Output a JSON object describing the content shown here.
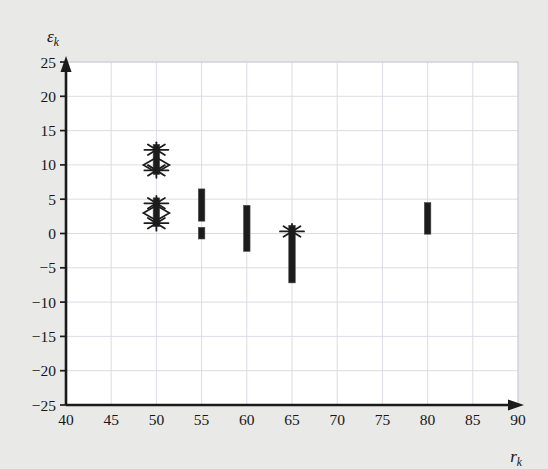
{
  "figure": {
    "background_color": "#e9e9e7",
    "plot_background_color": "#ffffff",
    "axis_color": "#1a1a1a",
    "grid_color": "#d8d8e2",
    "series_color": "#1c1c1c"
  },
  "axes": {
    "y_title": "ε",
    "y_title_sub": "k",
    "x_title": "r",
    "x_title_sub": "k",
    "y_ticks": [
      "25",
      "20",
      "15",
      "10",
      "5",
      "0",
      "−5",
      "−10",
      "−15",
      "−20",
      "−25"
    ],
    "x_ticks": [
      "40",
      "45",
      "50",
      "55",
      "60",
      "65",
      "70",
      "75",
      "80",
      "85",
      "90"
    ]
  },
  "chart_data": {
    "type": "scatter",
    "title": "",
    "xlabel": "r_k",
    "ylabel": "ε_k",
    "xlim": [
      40,
      90
    ],
    "ylim": [
      -25,
      25
    ],
    "xticks": [
      40,
      45,
      50,
      55,
      60,
      65,
      70,
      75,
      80,
      85,
      90
    ],
    "yticks": [
      -25,
      -20,
      -15,
      -10,
      -5,
      0,
      5,
      10,
      15,
      20,
      25
    ],
    "grid": true,
    "legend": "none",
    "groups": [
      {
        "x": 50,
        "y_min": 1.0,
        "y_max": 13.0,
        "segments": [
          {
            "y_min": 8.6,
            "y_max": 13.0
          },
          {
            "y_min": 1.0,
            "y_max": 5.2
          }
        ],
        "markers": [
          {
            "y": 12.2,
            "shape": "asterisk"
          },
          {
            "y": 10.0,
            "shape": "diamond"
          },
          {
            "y": 9.2,
            "shape": "asterisk"
          },
          {
            "y": 4.4,
            "shape": "asterisk"
          },
          {
            "y": 3.0,
            "shape": "diamond"
          },
          {
            "y": 1.5,
            "shape": "asterisk"
          }
        ]
      },
      {
        "x": 55,
        "y_min": -0.8,
        "y_max": 6.5,
        "segments": [
          {
            "y_min": 1.8,
            "y_max": 6.5
          },
          {
            "y_min": -0.8,
            "y_max": 0.9
          }
        ],
        "markers": []
      },
      {
        "x": 60,
        "y_min": -2.6,
        "y_max": 4.1,
        "segments": [
          {
            "y_min": -2.6,
            "y_max": 4.1
          }
        ],
        "markers": []
      },
      {
        "x": 65,
        "y_min": -7.2,
        "y_max": 1.2,
        "segments": [
          {
            "y_min": -7.2,
            "y_max": 1.2
          }
        ],
        "markers": [
          {
            "y": 0.3,
            "shape": "asterisk"
          }
        ]
      },
      {
        "x": 80,
        "y_min": -0.1,
        "y_max": 4.5,
        "segments": [
          {
            "y_min": -0.1,
            "y_max": 4.5
          }
        ],
        "markers": []
      }
    ]
  }
}
